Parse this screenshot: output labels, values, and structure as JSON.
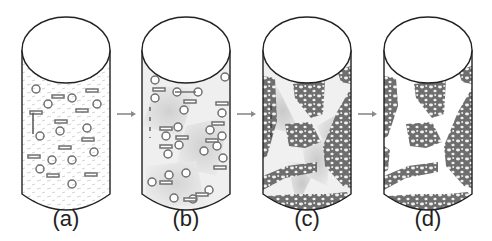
{
  "diagram": {
    "panels": [
      {
        "id": "a",
        "label": "(a)",
        "cx": 66,
        "content": "dispersed-particles"
      },
      {
        "id": "b",
        "label": "(b)",
        "cx": 186,
        "content": "linked-particles-in-domains"
      },
      {
        "id": "c",
        "label": "(c)",
        "cx": 307,
        "content": "network-clusters-with-domains"
      },
      {
        "id": "d",
        "label": "(d)",
        "cx": 428,
        "content": "network-clusters"
      }
    ],
    "arrows": [
      {
        "from": "a",
        "to": "b"
      },
      {
        "from": "b",
        "to": "c"
      },
      {
        "from": "c",
        "to": "d"
      }
    ],
    "colors": {
      "outline": "#222222",
      "particle": "#707070",
      "network": "#6e6e6e",
      "domain_shade": "#d4d4d4",
      "arrow": "#8a8a8a"
    }
  }
}
